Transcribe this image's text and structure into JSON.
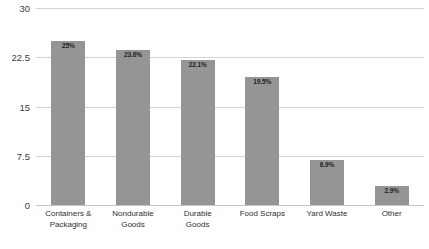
{
  "chart_data": {
    "type": "bar",
    "title": "",
    "xlabel": "",
    "ylabel": "",
    "categories": [
      "Containers &\nPackaging",
      "Nondurable\nGoods",
      "Durable\nGoods",
      "Food Scraps",
      "Yard Waste",
      "Other"
    ],
    "values": [
      25,
      23.6,
      22.1,
      19.5,
      6.9,
      2.9
    ],
    "data_labels": [
      "25%",
      "23.6%",
      "22.1%",
      "19.5%",
      "6.9%",
      "2.9%"
    ],
    "ylim": [
      0,
      30
    ],
    "yticks": [
      30,
      22.5,
      15,
      7.5,
      0
    ],
    "ytick_labels": [
      "30",
      "22.5",
      "15",
      "7.5",
      "0"
    ],
    "grid": true,
    "legend": "none",
    "bar_color": "#959595",
    "gridline_color": "#d3d3d3",
    "label_color": "#1d1d1d",
    "background": "#ffffff"
  }
}
